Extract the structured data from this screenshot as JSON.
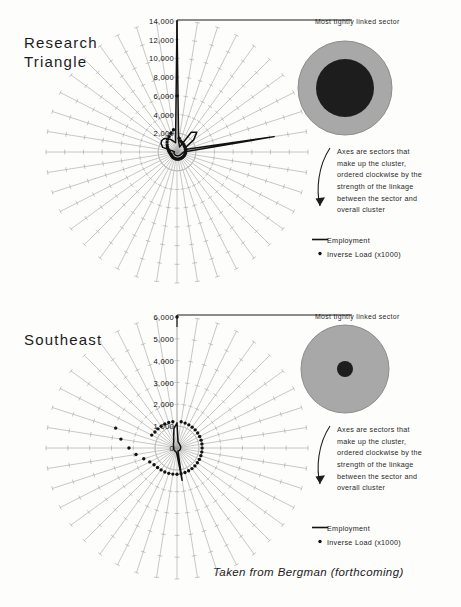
{
  "figure": {
    "caption": "Taken from Bergman (forthcoming)",
    "background": "#fdfdfc",
    "grid_color": "#9a9a9a",
    "data_color": "#121212",
    "disc_fill": "#a8a8a8",
    "disc_core": "#1d1d1d"
  },
  "panels": [
    {
      "id": "research-triangle",
      "title": "Research\nTriangle",
      "callout_top": "Most tightly linked sector",
      "callout_axes": "Axes are sectors that\nmake up the cluster,\nordered clockwise by the\nstrength of the linkage\nbetween the sector and\noverall cluster",
      "legend": {
        "line_label": "Employment",
        "dot_label": "Inverse Load (x1000)"
      },
      "chart_data": {
        "type": "line",
        "title": "Research Triangle",
        "xlabel": "",
        "ylabel": "",
        "rlim": [
          0,
          14000
        ],
        "rticks": [
          "0",
          "2,000",
          "4,000",
          "6,000",
          "8,000",
          "10,000",
          "12,000",
          "14,000"
        ],
        "rtick_values": [
          0,
          2000,
          4000,
          6000,
          8000,
          10000,
          12000,
          14000
        ],
        "n_sectors": 40,
        "grid": true,
        "legend_position": "right",
        "series": [
          {
            "name": "Employment",
            "style": "line",
            "values": [
              14000,
              1100,
              800,
              600,
              2600,
              3000,
              2200,
              1000,
              900,
              10500,
              700,
              600,
              550,
              500,
              480,
              460,
              440,
              430,
              420,
              410,
              400,
              390,
              380,
              370,
              360,
              350,
              340,
              330,
              320,
              310,
              300,
              290,
              1600,
              1900,
              2050,
              2000,
              1800,
              1500,
              1200,
              1000
            ]
          },
          {
            "name": "Inverse Load (x1000)",
            "style": "dots",
            "values": [
              6000,
              1500,
              1250,
              1150,
              1100,
              1050,
              1000,
              980,
              960,
              940,
              920,
              900,
              880,
              860,
              840,
              820,
              800,
              790,
              780,
              770,
              760,
              750,
              740,
              730,
              720,
              710,
              700,
              700,
              720,
              760,
              820,
              900,
              1000,
              1150,
              1300,
              1500,
              1700,
              1850,
              2100,
              2400
            ]
          }
        ]
      },
      "disc": {
        "outer_r": 47,
        "core_r": 29
      }
    },
    {
      "id": "southeast",
      "title": "Southeast",
      "callout_top": "Most tightly linked sector",
      "callout_axes": "Axes are sectors that\nmake up the cluster,\nordered clockwise by the\nstrength of the linkage\nbetween the sector and\noverall cluster",
      "legend": {
        "line_label": "Employment",
        "dot_label": "Inverse Load (x1000)"
      },
      "chart_data": {
        "type": "line",
        "title": "Southeast",
        "xlabel": "",
        "ylabel": "",
        "rlim": [
          0,
          6000
        ],
        "rticks": [
          "0",
          "1,000",
          "2,000",
          "3,000",
          "4,000",
          "5,000",
          "6,000"
        ],
        "rtick_values": [
          0,
          1000,
          2000,
          3000,
          4000,
          5000,
          6000
        ],
        "n_sectors": 40,
        "grid": true,
        "legend_position": "right",
        "series": [
          {
            "name": "Employment",
            "style": "line",
            "values": [
              1150,
              300,
              250,
              220,
              200,
              190,
              185,
              180,
              175,
              170,
              165,
              160,
              158,
              156,
              154,
              152,
              150,
              148,
              146,
              1500,
              300,
              200,
              180,
              170,
              165,
              160,
              158,
              156,
              154,
              152,
              150,
              150,
              160,
              180,
              200,
              230,
              270,
              330,
              500,
              900
            ]
          },
          {
            "name": "Inverse Load (x1000)",
            "style": "dots",
            "values": [
              6000,
              1220,
              1200,
              1190,
              1180,
              1175,
              1170,
              1165,
              1160,
              1155,
              1150,
              1150,
              1150,
              1150,
              1155,
              1160,
              1165,
              1170,
              1180,
              1190,
              1200,
              1210,
              1220,
              1230,
              1240,
              1260,
              1300,
              1400,
              1600,
              1900,
              2200,
              2600,
              2950,
              1300,
              1250,
              1240,
              1235,
              1230,
              1225,
              1220
            ]
          }
        ]
      },
      "disc": {
        "outer_r": 44,
        "core_r": 8
      }
    }
  ]
}
